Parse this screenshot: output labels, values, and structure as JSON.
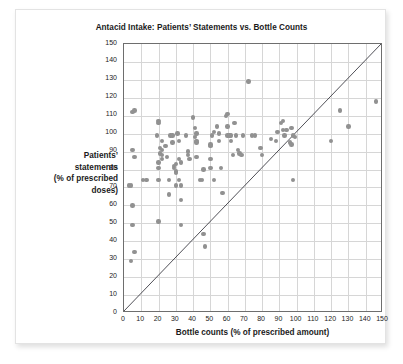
{
  "chart_data": {
    "type": "scatter",
    "title": "Antacid Intake: Patients’ Statements vs. Bottle Counts",
    "xlabel": "Bottle counts (% of prescribed amount)",
    "ylabel": "Patients’ statements (% of prescribed doses)",
    "ylabel_lines": [
      "Patients’",
      "statements",
      "(% of prescribed",
      "doses)"
    ],
    "xlim": [
      0,
      150
    ],
    "ylim": [
      0,
      150
    ],
    "xticks": [
      0,
      10,
      20,
      30,
      40,
      50,
      60,
      70,
      80,
      90,
      100,
      110,
      120,
      130,
      140,
      150
    ],
    "yticks": [
      0,
      10,
      20,
      30,
      40,
      50,
      60,
      70,
      80,
      90,
      100,
      110,
      120,
      130,
      140,
      150
    ],
    "grid": true,
    "legend": null,
    "marker_color": "#919191",
    "reference_line": {
      "name": "y = x identity line",
      "from": [
        0,
        0
      ],
      "to": [
        150,
        150
      ],
      "color": "#3a3a42"
    },
    "points": [
      [
        3,
        71
      ],
      [
        4,
        71
      ],
      [
        5,
        91
      ],
      [
        6,
        87
      ],
      [
        5,
        112
      ],
      [
        6,
        113
      ],
      [
        5,
        60
      ],
      [
        5,
        49
      ],
      [
        6,
        34
      ],
      [
        4,
        29
      ],
      [
        11,
        74
      ],
      [
        13,
        74
      ],
      [
        19,
        99
      ],
      [
        20,
        107
      ],
      [
        20,
        106
      ],
      [
        20,
        84
      ],
      [
        20,
        81
      ],
      [
        20,
        74
      ],
      [
        20,
        51
      ],
      [
        21,
        92
      ],
      [
        21,
        89
      ],
      [
        22,
        96
      ],
      [
        22,
        91
      ],
      [
        22,
        88
      ],
      [
        22,
        86
      ],
      [
        24,
        93
      ],
      [
        25,
        87
      ],
      [
        26,
        74
      ],
      [
        26,
        66
      ],
      [
        27,
        99
      ],
      [
        28,
        99
      ],
      [
        28,
        95
      ],
      [
        29,
        82
      ],
      [
        29,
        81
      ],
      [
        30,
        83
      ],
      [
        30,
        79
      ],
      [
        30,
        78
      ],
      [
        30,
        71
      ],
      [
        31,
        100
      ],
      [
        32,
        96
      ],
      [
        32,
        86
      ],
      [
        32,
        74
      ],
      [
        33,
        84
      ],
      [
        33,
        71
      ],
      [
        33,
        63
      ],
      [
        33,
        49
      ],
      [
        36,
        99
      ],
      [
        37,
        90
      ],
      [
        37,
        88
      ],
      [
        38,
        86
      ],
      [
        40,
        109
      ],
      [
        41,
        103
      ],
      [
        41,
        98
      ],
      [
        42,
        100
      ],
      [
        42,
        96
      ],
      [
        42,
        95
      ],
      [
        42,
        87
      ],
      [
        44,
        74
      ],
      [
        45,
        74
      ],
      [
        46,
        80
      ],
      [
        46,
        44
      ],
      [
        47,
        37
      ],
      [
        50,
        94
      ],
      [
        50,
        93
      ],
      [
        50,
        86
      ],
      [
        50,
        81
      ],
      [
        51,
        99
      ],
      [
        52,
        101
      ],
      [
        52,
        74
      ],
      [
        54,
        104
      ],
      [
        55,
        100
      ],
      [
        55,
        96
      ],
      [
        56,
        81
      ],
      [
        57,
        67
      ],
      [
        59,
        110
      ],
      [
        60,
        111
      ],
      [
        60,
        104
      ],
      [
        60,
        99
      ],
      [
        61,
        99
      ],
      [
        62,
        99
      ],
      [
        62,
        96
      ],
      [
        63,
        88
      ],
      [
        64,
        106
      ],
      [
        65,
        99
      ],
      [
        66,
        91
      ],
      [
        67,
        89
      ],
      [
        68,
        88
      ],
      [
        69,
        99
      ],
      [
        72,
        129
      ],
      [
        74,
        99
      ],
      [
        76,
        99
      ],
      [
        79,
        92
      ],
      [
        80,
        88
      ],
      [
        85,
        97
      ],
      [
        88,
        96
      ],
      [
        89,
        101
      ],
      [
        91,
        106
      ],
      [
        92,
        107
      ],
      [
        92,
        102
      ],
      [
        93,
        99
      ],
      [
        94,
        102
      ],
      [
        96,
        95
      ],
      [
        97,
        94
      ],
      [
        97,
        103
      ],
      [
        98,
        99
      ],
      [
        99,
        98
      ],
      [
        98,
        74
      ],
      [
        120,
        96
      ],
      [
        125,
        113
      ],
      [
        130,
        104
      ],
      [
        146,
        118
      ]
    ]
  }
}
